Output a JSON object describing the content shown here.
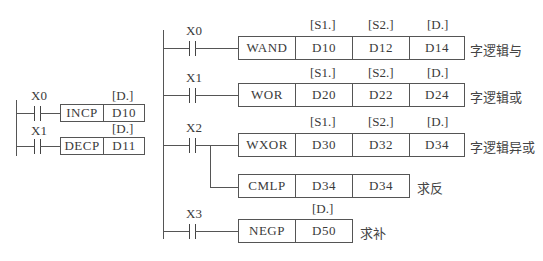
{
  "left_section": {
    "rungs": [
      {
        "contact": "X0",
        "instruction": "INCP",
        "operands": [
          {
            "label": "[D.]",
            "value": "D10"
          }
        ]
      },
      {
        "contact": "X1",
        "instruction": "DECP",
        "operands": [
          {
            "label": "[D.]",
            "value": "D11"
          }
        ]
      }
    ]
  },
  "right_section": {
    "rungs": [
      {
        "contact": "X0",
        "instruction": "WAND",
        "operands": [
          {
            "label": "[S1.]",
            "value": "D10"
          },
          {
            "label": "[S2.]",
            "value": "D12"
          },
          {
            "label": "[D.]",
            "value": "D14"
          }
        ],
        "comment": "字逻辑与"
      },
      {
        "contact": "X1",
        "instruction": "WOR",
        "operands": [
          {
            "label": "[S1.]",
            "value": "D20"
          },
          {
            "label": "[S2.]",
            "value": "D22"
          },
          {
            "label": "[D.]",
            "value": "D24"
          }
        ],
        "comment": "字逻辑或"
      },
      {
        "contact": "X2",
        "instruction": "WXOR",
        "operands": [
          {
            "label": "[S1.]",
            "value": "D30"
          },
          {
            "label": "[S2.]",
            "value": "D32"
          },
          {
            "label": "[D.]",
            "value": "D34"
          }
        ],
        "comment": "字逻辑异或"
      },
      {
        "contact": "",
        "instruction": "CMLP",
        "operands": [
          {
            "label": "",
            "value": "D34"
          },
          {
            "label": "",
            "value": "D34"
          }
        ],
        "comment": "求反"
      },
      {
        "contact": "X3",
        "instruction": "NEGP",
        "operands": [
          {
            "label": "[D.]",
            "value": "D50"
          }
        ],
        "comment": "求补"
      }
    ]
  },
  "colors": {
    "line": "#555555",
    "text": "#3a3a3a",
    "background": "#ffffff"
  }
}
